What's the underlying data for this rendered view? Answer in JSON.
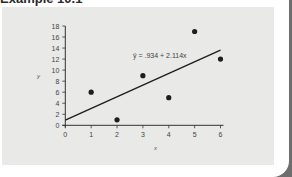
{
  "page": {
    "title": "Example 10.1"
  },
  "chart_data": {
    "type": "scatter",
    "title": "",
    "xlabel": "x",
    "ylabel": "y",
    "xlim": [
      0,
      6
    ],
    "ylim": [
      0,
      18
    ],
    "x_ticks": [
      0,
      1,
      2,
      3,
      4,
      5,
      6
    ],
    "y_ticks": [
      0,
      2,
      4,
      6,
      8,
      10,
      12,
      14,
      16,
      18
    ],
    "grid": false,
    "series": [
      {
        "name": "observations",
        "type": "scatter",
        "x": [
          1,
          2,
          3,
          4,
          5,
          6
        ],
        "y": [
          6,
          1,
          9,
          5,
          17,
          12
        ]
      },
      {
        "name": "regression line",
        "type": "line",
        "intercept": 0.934,
        "slope": 2.114,
        "x": [
          0,
          6
        ],
        "y": [
          0.934,
          13.618
        ]
      }
    ],
    "annotations": [
      {
        "text": "ŷ = .934 + 2.114x",
        "x": 3.0,
        "y": 12.3
      }
    ]
  },
  "colors": {
    "panel": "#e9e9e7",
    "ink": "#1e1e1e",
    "edge": "#6e6e6e"
  }
}
